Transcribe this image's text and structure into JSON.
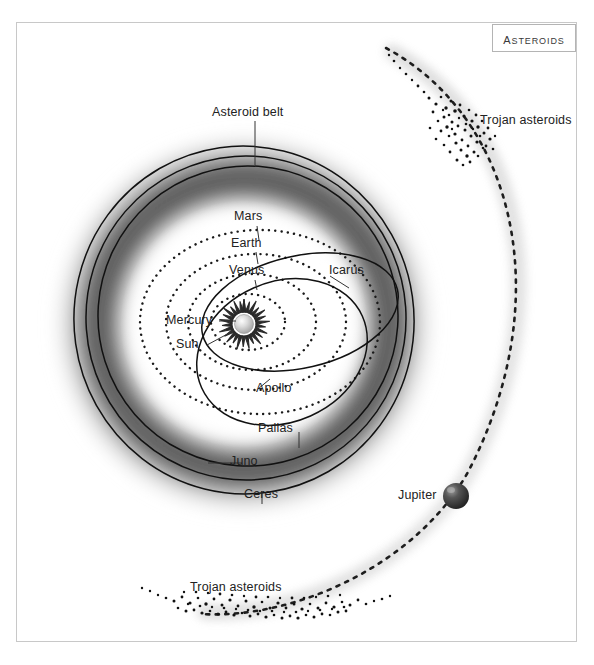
{
  "title": {
    "text": "Asteroids"
  },
  "frame": {
    "border_color": "#c8c8c8",
    "background": "#ffffff"
  },
  "labels": {
    "asteroid_belt": "Asteroid belt",
    "mars": "Mars",
    "earth": "Earth",
    "venus": "Venus",
    "mercury": "Mercury",
    "sun": "Sun",
    "icarus": "Icarus",
    "apollo": "Apollo",
    "pallas": "Pallas",
    "juno": "Juno",
    "ceres": "Ceres",
    "jupiter": "Jupiter",
    "trojan_upper": "Trojan asteroids",
    "trojan_lower": "Trojan asteroids"
  },
  "colors": {
    "orbit_line": "#1a1a1a",
    "belt_dark": "#4a4a4a",
    "belt_light": "#d9d9d9",
    "jupiter_body": "#3c3c3c",
    "sun_core": "#d0d0d0",
    "asteroid_dot": "#111111",
    "frame": "#c8c8c8",
    "text": "#222222"
  },
  "diagram": {
    "type": "solar-system-schematic",
    "center": {
      "x": 244,
      "y": 324
    },
    "planet_orbits": [
      {
        "name": "Mercury",
        "rx": 36,
        "ry": 27,
        "style": "dotted"
      },
      {
        "name": "Venus",
        "rx": 62,
        "ry": 47,
        "style": "dotted"
      },
      {
        "name": "Earth",
        "rx": 88,
        "ry": 67,
        "style": "dotted"
      },
      {
        "name": "Mars",
        "rx": 118,
        "ry": 90,
        "style": "dotted"
      }
    ],
    "asteroid_orbits": [
      {
        "name": "Ceres",
        "rx": 168,
        "ry": 172,
        "style": "solid"
      },
      {
        "name": "Juno",
        "rx": 158,
        "ry": 160,
        "style": "solid"
      },
      {
        "name": "Pallas",
        "rx": 148,
        "ry": 148,
        "style": "solid"
      }
    ],
    "eccentric_orbits": [
      {
        "name": "Icarus",
        "rx": 98,
        "ry": 54,
        "rotation": -14,
        "cx_offset": 52,
        "cy_offset": -10,
        "style": "solid"
      },
      {
        "name": "Apollo",
        "rx": 86,
        "ry": 66,
        "rotation": -22,
        "cx_offset": 34,
        "cy_offset": 28,
        "style": "solid"
      }
    ],
    "belt": {
      "inner_radius": 128,
      "outer_radius": 196,
      "rendering": "soft-gradient-ring"
    },
    "jupiter": {
      "x": 456,
      "y": 496,
      "radius": 13
    },
    "jupiter_orbit": {
      "style": "dashed",
      "band": "soft-gray-glow"
    },
    "trojan_clusters": [
      {
        "position": "upper",
        "count": 95
      },
      {
        "position": "lower",
        "count": 130
      }
    ]
  }
}
